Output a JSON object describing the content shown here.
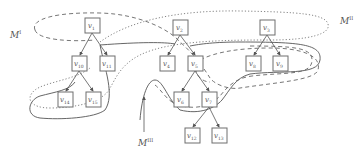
{
  "diagram": {
    "type": "tree-partition",
    "nodes": [
      {
        "id": "v1",
        "label": "v",
        "sub": "1",
        "x": 85,
        "y": 18
      },
      {
        "id": "v10",
        "label": "v",
        "sub": "10",
        "x": 72,
        "y": 56
      },
      {
        "id": "v11",
        "label": "v",
        "sub": "11",
        "x": 100,
        "y": 56
      },
      {
        "id": "v14",
        "label": "v",
        "sub": "14",
        "x": 58,
        "y": 92
      },
      {
        "id": "v15",
        "label": "v",
        "sub": "15",
        "x": 86,
        "y": 92
      },
      {
        "id": "v2",
        "label": "v",
        "sub": "2",
        "x": 173,
        "y": 20
      },
      {
        "id": "v4",
        "label": "v",
        "sub": "4",
        "x": 160,
        "y": 56
      },
      {
        "id": "v5",
        "label": "v",
        "sub": "5",
        "x": 188,
        "y": 56
      },
      {
        "id": "v6",
        "label": "v",
        "sub": "6",
        "x": 174,
        "y": 92
      },
      {
        "id": "v7",
        "label": "v",
        "sub": "7",
        "x": 202,
        "y": 92
      },
      {
        "id": "v12",
        "label": "v",
        "sub": "12",
        "x": 185,
        "y": 128
      },
      {
        "id": "v13",
        "label": "v",
        "sub": "13",
        "x": 212,
        "y": 128
      },
      {
        "id": "v3",
        "label": "v",
        "sub": "3",
        "x": 260,
        "y": 20
      },
      {
        "id": "v8",
        "label": "v",
        "sub": "8",
        "x": 246,
        "y": 56
      },
      {
        "id": "v9",
        "label": "v",
        "sub": "9",
        "x": 273,
        "y": 56
      }
    ],
    "edges": [
      [
        "v1",
        "v10"
      ],
      [
        "v1",
        "v11"
      ],
      [
        "v10",
        "v14"
      ],
      [
        "v10",
        "v15"
      ],
      [
        "v2",
        "v4"
      ],
      [
        "v2",
        "v5"
      ],
      [
        "v5",
        "v6"
      ],
      [
        "v5",
        "v7"
      ],
      [
        "v7",
        "v12"
      ],
      [
        "v7",
        "v13"
      ],
      [
        "v3",
        "v8"
      ],
      [
        "v3",
        "v9"
      ]
    ],
    "regions": [
      {
        "name": "M_I",
        "label": "M",
        "sup": "I",
        "style": "dashed"
      },
      {
        "name": "M_II",
        "label": "M",
        "sup": "II",
        "style": "dotted"
      },
      {
        "name": "M_III",
        "label": "M",
        "sup": "III",
        "style": "solid"
      }
    ],
    "labels": {
      "m1": {
        "text": "M",
        "sup": "I"
      },
      "m2": {
        "text": "M",
        "sup": "II"
      },
      "m3": {
        "text": "M",
        "sup": "III"
      }
    }
  }
}
